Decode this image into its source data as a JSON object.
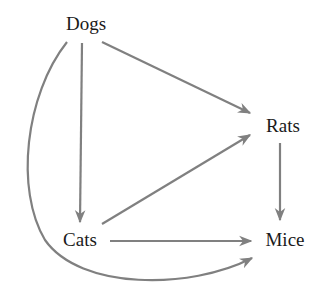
{
  "diagram": {
    "type": "directed-graph",
    "edge_color": "#808080",
    "text_color": "#1a1a1a",
    "nodes": [
      {
        "id": "dogs",
        "label": "Dogs"
      },
      {
        "id": "rats",
        "label": "Rats"
      },
      {
        "id": "cats",
        "label": "Cats"
      },
      {
        "id": "mice",
        "label": "Mice"
      }
    ],
    "edges": [
      {
        "from": "Dogs",
        "to": "Rats"
      },
      {
        "from": "Dogs",
        "to": "Cats"
      },
      {
        "from": "Dogs",
        "to": "Mice",
        "style": "curved"
      },
      {
        "from": "Cats",
        "to": "Rats"
      },
      {
        "from": "Cats",
        "to": "Mice"
      },
      {
        "from": "Rats",
        "to": "Mice"
      }
    ]
  }
}
